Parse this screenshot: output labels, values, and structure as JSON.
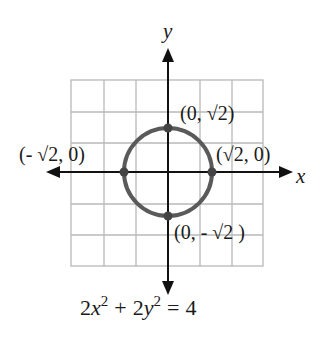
{
  "diagram": {
    "type": "coordinate-graph",
    "axes": {
      "x_label": "x",
      "y_label": "y"
    },
    "grid": {
      "columns": 6,
      "rows": 6,
      "color": "#b8b8b8"
    },
    "curve": {
      "shape": "circle",
      "center": [
        0,
        0
      ],
      "radius": "√2",
      "color": "#5a5a5a"
    },
    "points": [
      {
        "label": "(0, √2)",
        "coords": [
          0,
          1.414
        ]
      },
      {
        "label": "(-√2, 0)",
        "coords": [
          -1.414,
          0
        ]
      },
      {
        "label": "(√2, 0)",
        "coords": [
          1.414,
          0
        ]
      },
      {
        "label": "(0, -√2)",
        "coords": [
          0,
          -1.414
        ]
      }
    ],
    "labels": {
      "top": "(0, √2)",
      "left": "(- √2, 0)",
      "right": "(√2, 0)",
      "bottom": "(0, - √2 )"
    },
    "equation": {
      "lhs_a": "2",
      "var1": "x",
      "exp1": "2",
      "plus": "+",
      "lhs_b": "2",
      "var2": "y",
      "exp2": "2",
      "eq": "=",
      "rhs": "4",
      "full": "2x² + 2y² = 4"
    }
  }
}
